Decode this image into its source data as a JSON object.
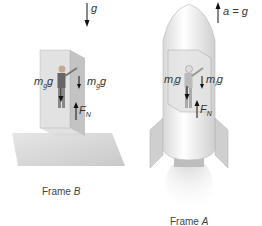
{
  "figure": {
    "frame_b": {
      "caption_prefix": "Frame ",
      "caption_var": "B",
      "gravity_label": "g",
      "left_force_m": "m",
      "left_force_sub": "g",
      "left_force_g": "g",
      "right_force_m": "m",
      "right_force_sub": "g",
      "right_force_g": "g",
      "normal_force": "F",
      "normal_force_sub": "N"
    },
    "frame_a": {
      "caption_prefix": "Frame ",
      "caption_var": "A",
      "acceleration_label": "a = g",
      "left_force_m": "m",
      "left_force_sub": "i",
      "left_force_g": "g",
      "right_force_m": "m",
      "right_force_sub": "i",
      "right_force_g": "g",
      "normal_force": "F",
      "normal_force_sub": "N"
    }
  }
}
